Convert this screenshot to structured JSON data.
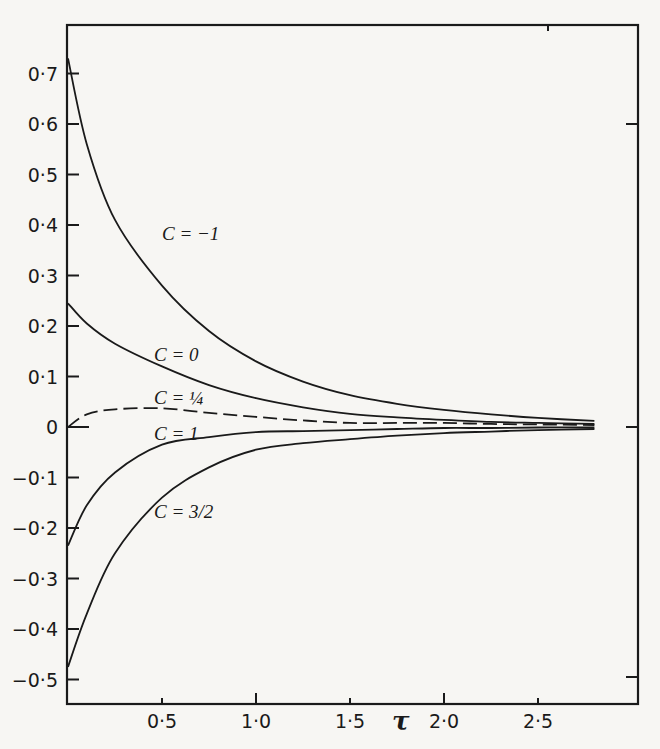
{
  "chart_data": {
    "type": "line",
    "title": "",
    "xlabel": "τ",
    "ylabel": "",
    "xlim": [
      0,
      3.0
    ],
    "ylim": [
      -0.55,
      0.77
    ],
    "grid": false,
    "legend": "inline curve labels",
    "x_ticks": [
      0.5,
      1.0,
      1.5,
      2.0,
      2.5
    ],
    "x_tick_labels": [
      "0·5",
      "1·0",
      "1·5",
      "2·0",
      "2·5"
    ],
    "y_ticks": [
      0.7,
      0.6,
      0.5,
      0.4,
      0.3,
      0.2,
      0.1,
      0,
      -0.1,
      -0.2,
      -0.3,
      -0.4,
      -0.5
    ],
    "y_tick_labels": [
      "0·7",
      "0·6",
      "0·5",
      "0·4",
      "0·3",
      "0·2",
      "0·1",
      "0",
      "−0·1",
      "−0·2",
      "−0·3",
      "−0·4",
      "−0·5"
    ],
    "x": [
      0,
      0.1,
      0.25,
      0.5,
      0.75,
      1.0,
      1.25,
      1.5,
      1.75,
      2.0,
      2.25,
      2.5,
      2.8
    ],
    "series": [
      {
        "name": "C = −1",
        "values": [
          0.73,
          0.56,
          0.41,
          0.28,
          0.19,
          0.13,
          0.09,
          0.063,
          0.046,
          0.034,
          0.025,
          0.018,
          0.012
        ]
      },
      {
        "name": "C = 0",
        "values": [
          0.245,
          0.205,
          0.165,
          0.12,
          0.083,
          0.057,
          0.039,
          0.026,
          0.019,
          0.014,
          0.01,
          0.008,
          0.006
        ]
      },
      {
        "name": "C = ¼",
        "values": [
          0.0,
          0.025,
          0.035,
          0.037,
          0.028,
          0.02,
          0.013,
          0.008,
          0.008,
          0.008,
          0.006,
          0.005,
          0.004
        ]
      },
      {
        "name": "C = 1",
        "values": [
          -0.235,
          -0.155,
          -0.09,
          -0.035,
          -0.02,
          -0.01,
          -0.008,
          -0.006,
          -0.004,
          -0.002,
          -0.002,
          -0.001,
          -0.001
        ]
      },
      {
        "name": "C = 3/2",
        "values": [
          -0.475,
          -0.37,
          -0.25,
          -0.14,
          -0.08,
          -0.045,
          -0.032,
          -0.024,
          -0.017,
          -0.012,
          -0.009,
          -0.006,
          -0.004
        ]
      }
    ]
  },
  "labels": {
    "xlabel": "τ",
    "curves": [
      {
        "text": "C = −1",
        "x": 0.5,
        "y": 0.37
      },
      {
        "text": "C = 0",
        "x": 0.5,
        "y": 0.13
      },
      {
        "text": "C = ¼",
        "x": 0.5,
        "y": 0.045
      },
      {
        "text": "C = 1",
        "x": 0.5,
        "y": -0.025
      },
      {
        "text": "C = 3/2",
        "x": 0.5,
        "y": -0.18
      }
    ]
  }
}
